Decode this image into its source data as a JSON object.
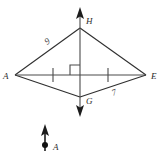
{
  "figure": {
    "background_color": "#ffffff",
    "line_color": "#2f2f2f",
    "label_color": "#2b2b2b"
  },
  "vertices": [
    {
      "id": "H",
      "label": "H",
      "x": 80,
      "y": 28,
      "label_x": 86,
      "label_y": 24
    },
    {
      "id": "A",
      "label": "A",
      "x": 15,
      "y": 75,
      "label_x": 3,
      "label_y": 79
    },
    {
      "id": "E",
      "label": "E",
      "x": 146,
      "y": 75,
      "label_x": 151,
      "label_y": 79
    },
    {
      "id": "G",
      "label": "G",
      "x": 80,
      "y": 97,
      "label_x": 86,
      "label_y": 104
    }
  ],
  "intersection": {
    "id": "center",
    "x": 80,
    "y": 75
  },
  "edges": [
    {
      "id": "AH",
      "from": "A",
      "to": "H"
    },
    {
      "id": "HE",
      "from": "H",
      "to": "E"
    },
    {
      "id": "AG",
      "from": "A",
      "to": "G"
    },
    {
      "id": "GE",
      "from": "G",
      "to": "E"
    }
  ],
  "diagonals": {
    "horizontal": {
      "id": "AE",
      "x1": 15,
      "y1": 75,
      "x2": 146,
      "y2": 75
    },
    "vertical": {
      "id": "HG",
      "x1": 80,
      "y1": 12,
      "x2": 80,
      "y2": 112
    }
  },
  "measure_labels": [
    {
      "id": "side-ah-length",
      "text": "9",
      "x": 47,
      "y": 45,
      "rotation": -35,
      "on_edge": "AH"
    },
    {
      "id": "side-ge-length",
      "text": "7",
      "x": 113,
      "y": 96,
      "rotation": -21,
      "on_edge": "GE"
    }
  ],
  "tick_marks": [
    {
      "id": "tick-left",
      "x": 53,
      "y": 75,
      "half_height": 7
    },
    {
      "id": "tick-right",
      "x": 108,
      "y": 75,
      "half_height": 7
    }
  ],
  "right_angle_marker": {
    "id": "right-angle-at-center",
    "x": 70,
    "y": 64,
    "size": 10
  },
  "ray_arrows": [
    {
      "id": "arrow-up-H",
      "direction": "up",
      "tip_x": 80,
      "tip_y": 7
    },
    {
      "id": "arrow-down-G",
      "direction": "down",
      "tip_x": 80,
      "tip_y": 117
    }
  ],
  "inset_vector": {
    "id": "vector-a",
    "label": "A",
    "label_x": 53,
    "label_y": 150,
    "line_x": 45,
    "line_top_y": 128,
    "line_bottom_y": 151,
    "arrow_tip_y": 124,
    "dot_x": 45,
    "dot_y": 145,
    "dot_radius": 3
  }
}
